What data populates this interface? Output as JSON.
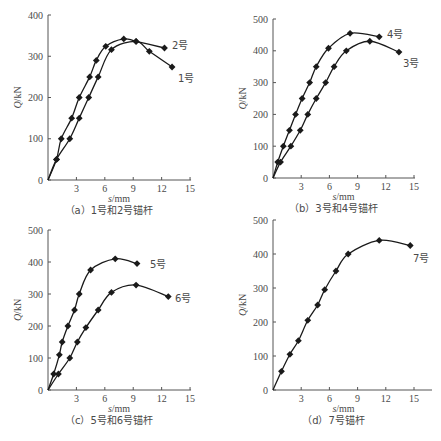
{
  "chart_data": [
    {
      "id": "a",
      "type": "line",
      "caption": "（a）1号和2号锚杆",
      "xlabel": "s/mm",
      "ylabel": "Q/kN",
      "xlim": [
        0,
        15
      ],
      "ylim": [
        0,
        400
      ],
      "xticks": [
        3,
        6,
        9,
        12,
        15
      ],
      "yticks": [
        0,
        100,
        200,
        300,
        400
      ],
      "grid": false,
      "legend": "inline labels",
      "series": [
        {
          "name": "2号",
          "x": [
            0,
            0.9,
            1.4,
            2.5,
            3.3,
            4.4,
            5.1,
            6.1,
            8.0,
            9.3,
            12.3
          ],
          "y": [
            0,
            50,
            100,
            150,
            200,
            250,
            290,
            324,
            342,
            336,
            320
          ]
        },
        {
          "name": "1号",
          "x": [
            0,
            0.9,
            2.3,
            3.3,
            4.3,
            5.3,
            6.7,
            9.3,
            10.7,
            13.1
          ],
          "y": [
            0,
            50,
            100,
            150,
            200,
            250,
            316,
            336,
            312,
            274
          ]
        }
      ]
    },
    {
      "id": "b",
      "type": "line",
      "caption": "（b）3号和4号锚杆",
      "xlabel": "s/mm",
      "ylabel": "Q/kN",
      "xlim": [
        0,
        15
      ],
      "ylim": [
        0,
        500
      ],
      "xticks": [
        3,
        6,
        9,
        12,
        15
      ],
      "yticks": [
        0,
        100,
        200,
        300,
        400,
        500
      ],
      "grid": false,
      "legend": "inline labels",
      "series": [
        {
          "name": "4号",
          "x": [
            0,
            0.5,
            1.1,
            1.75,
            2.4,
            3.1,
            3.9,
            4.6,
            5.9,
            8.2,
            11.3
          ],
          "y": [
            0,
            50,
            100,
            150,
            200,
            250,
            300,
            350,
            408,
            455,
            444
          ]
        },
        {
          "name": "3号",
          "x": [
            0,
            0.8,
            1.9,
            2.9,
            3.7,
            4.6,
            5.6,
            6.5,
            7.8,
            10.3,
            13.4
          ],
          "y": [
            0,
            50,
            100,
            150,
            200,
            250,
            300,
            350,
            400,
            430,
            396
          ]
        }
      ]
    },
    {
      "id": "c",
      "type": "line",
      "caption": "（c）5号和6号锚杆",
      "xlabel": "s/mm",
      "ylabel": "Q/kN",
      "xlim": [
        0,
        15
      ],
      "ylim": [
        0,
        500
      ],
      "xticks": [
        3,
        6,
        9,
        12,
        15
      ],
      "yticks": [
        0,
        100,
        200,
        300,
        400,
        500
      ],
      "grid": false,
      "legend": "inline labels",
      "series": [
        {
          "name": "5号",
          "x": [
            0,
            0.6,
            1.2,
            1.5,
            2.1,
            2.8,
            3.3,
            4.5,
            7.1,
            9.4
          ],
          "y": [
            0,
            50,
            110,
            150,
            200,
            250,
            300,
            375,
            410,
            395
          ]
        },
        {
          "name": "6号",
          "x": [
            0,
            1.1,
            2.3,
            3.1,
            4.0,
            5.3,
            6.7,
            9.3,
            12.7
          ],
          "y": [
            0,
            50,
            100,
            150,
            195,
            250,
            305,
            328,
            292
          ]
        }
      ]
    },
    {
      "id": "d",
      "type": "line",
      "caption": "（d）7号锚杆",
      "xlabel": "s/mm",
      "ylabel": "Q/kN",
      "xlim": [
        0,
        16.5
      ],
      "ylim": [
        0,
        500
      ],
      "xticks": [
        3,
        6,
        9,
        12,
        15
      ],
      "yticks": [
        0,
        100,
        200,
        300,
        400,
        500
      ],
      "grid": false,
      "legend": "inline labels",
      "series": [
        {
          "name": "7号",
          "x": [
            0,
            0.9,
            1.8,
            2.7,
            3.7,
            4.75,
            5.5,
            6.7,
            8.0,
            11.3,
            14.6
          ],
          "y": [
            0,
            55,
            105,
            145,
            205,
            250,
            295,
            350,
            400,
            440,
            425
          ]
        }
      ]
    }
  ],
  "layout": {
    "panels": [
      {
        "ox": 48,
        "oy": 180,
        "pxPerX": 9.47,
        "yTop": 15,
        "labels": [
          {
            "text": "2号",
            "x": 172,
            "y": 49
          },
          {
            "text": "1号",
            "x": 178,
            "y": 82
          }
        ]
      },
      {
        "ox": 273,
        "oy": 178,
        "pxPerX": 9.4,
        "yTop": 19,
        "labels": [
          {
            "text": "4号",
            "x": 387,
            "y": 38
          },
          {
            "text": "3号",
            "x": 403,
            "y": 67
          }
        ]
      },
      {
        "ox": 48,
        "oy": 390,
        "pxPerX": 9.47,
        "yTop": 230,
        "labels": [
          {
            "text": "5号",
            "x": 150,
            "y": 268
          },
          {
            "text": "6号",
            "x": 175,
            "y": 302
          }
        ]
      },
      {
        "ox": 273,
        "oy": 390,
        "pxPerX": 9.4,
        "yTop": 220,
        "xAxisEnd": 432,
        "labels": [
          {
            "text": "7号",
            "x": 413,
            "y": 262
          }
        ]
      }
    ],
    "colors": {
      "line": "#1a1a1a",
      "axis": "#555555",
      "text": "#4a4a4a"
    }
  }
}
